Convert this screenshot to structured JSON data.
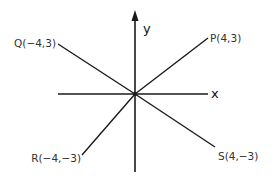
{
  "diagram": {
    "type": "coordinate-plane",
    "axes": {
      "x_label": "x",
      "y_label": "y"
    },
    "points": {
      "P": {
        "label": "P(4,3)",
        "x": 4,
        "y": 3
      },
      "Q": {
        "label": "Q(−4,3)",
        "x": -4,
        "y": 3
      },
      "R": {
        "label": "R(−4,−3)",
        "x": -4,
        "y": -3
      },
      "S": {
        "label": "S(4,−3)",
        "x": 4,
        "y": -3
      }
    },
    "segments": [
      {
        "from": "origin",
        "to": "P"
      },
      {
        "from": "origin",
        "to": "Q"
      },
      {
        "from": "origin",
        "to": "R"
      },
      {
        "from": "origin",
        "to": "S"
      }
    ],
    "colors": {
      "line": "#1a1a1a",
      "text": "#333333"
    }
  }
}
